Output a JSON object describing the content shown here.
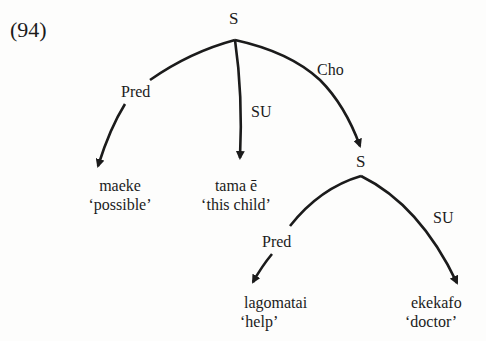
{
  "example_number": "(94)",
  "nodes": {
    "root": "S",
    "embedded": "S"
  },
  "edge_labels": {
    "root_pred": "Pred",
    "root_su": "SU",
    "root_cho": "Cho",
    "embedded_pred": "Pred",
    "embedded_su": "SU"
  },
  "leaves": [
    {
      "word": "maeke",
      "gloss": "‘possible’"
    },
    {
      "word": "tama ē",
      "gloss": "‘this child’"
    },
    {
      "word": "lagomatai",
      "gloss": "‘help’"
    },
    {
      "word": "ekekafo",
      "gloss": "‘doctor’"
    }
  ],
  "colors": {
    "ink": "#1b1b1b",
    "paper": "#fdfdfc"
  }
}
